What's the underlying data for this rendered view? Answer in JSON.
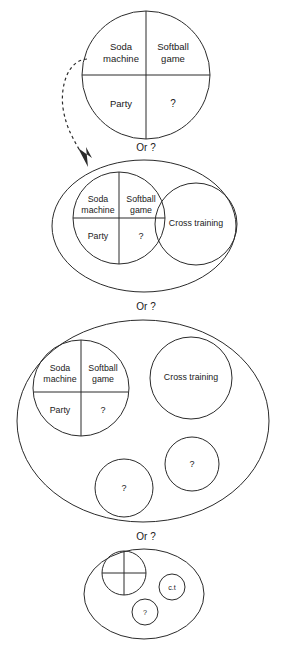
{
  "figure": {
    "connector_label": "Or ?",
    "connector_labels": [
      "Or ?",
      "Or ?",
      "Or ?"
    ],
    "colors": {
      "stroke": "#2b2b2b",
      "text": "#1a1a1a",
      "background": "#ffffff"
    }
  },
  "quadrant": {
    "soda_line1": "Soda",
    "soda_line2": "machine",
    "softball_line1": "Softball",
    "softball_line2": "game",
    "party": "Party",
    "unknown": "?"
  },
  "labels": {
    "cross_training": "Cross training",
    "cross_training_abbr": "c.t",
    "unknown": "?"
  },
  "stages": [
    {
      "id": "stage-1",
      "name": "single-quadrant-circle",
      "cells": [
        "Soda machine",
        "Softball game",
        "Party",
        "?"
      ]
    },
    {
      "id": "stage-2",
      "name": "ellipse-with-quadrant-and-cross-training",
      "cells": [
        "Soda machine",
        "Softball game",
        "Party",
        "?"
      ],
      "siblings": [
        "Cross training"
      ]
    },
    {
      "id": "stage-3",
      "name": "ellipse-with-quadrant-cross-training-and-two-unknowns",
      "cells": [
        "Soda machine",
        "Softball game",
        "Party",
        "?"
      ],
      "siblings": [
        "Cross training",
        "?",
        "?"
      ]
    },
    {
      "id": "stage-4",
      "name": "compressed-ellipse-summary",
      "siblings": [
        "c.t",
        "?"
      ]
    }
  ]
}
